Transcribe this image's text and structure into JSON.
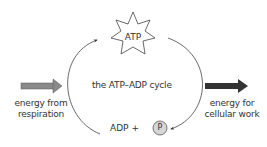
{
  "diagram": {
    "title": "the ATP–ADP cycle",
    "nodes": {
      "atp": {
        "label": "ATP",
        "shape": "star"
      },
      "adp": {
        "label": "ADP +"
      },
      "phosphate": {
        "label": "P",
        "shape": "circle",
        "fill": "#d6d6d6"
      }
    },
    "inputs": {
      "left": {
        "line1": "energy from",
        "line2": "respiration",
        "arrow_color": "#8a8a8a"
      },
      "right": {
        "line1": "energy for",
        "line2": "cellular work",
        "arrow_color": "#333333"
      }
    },
    "edges": [
      {
        "from": "adp",
        "to": "atp",
        "side": "left"
      },
      {
        "from": "atp",
        "to": "adp",
        "side": "right"
      }
    ]
  }
}
